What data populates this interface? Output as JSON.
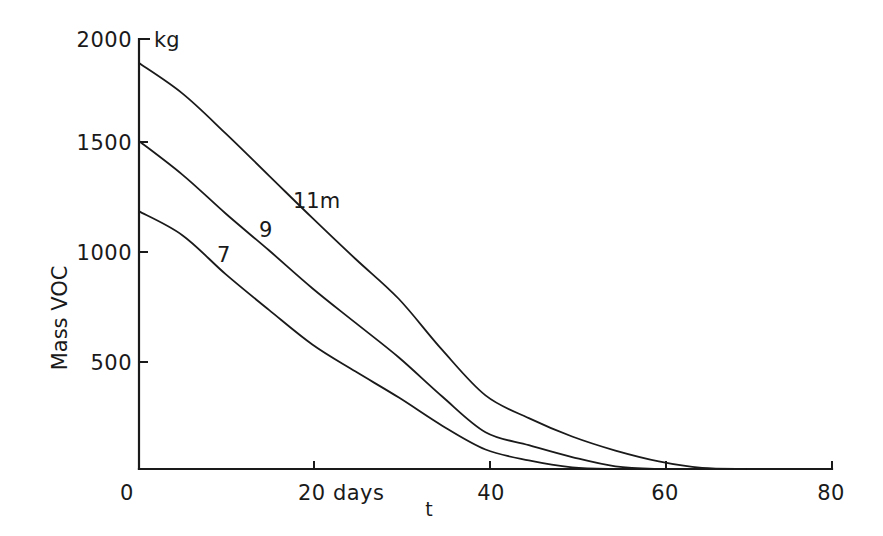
{
  "chart_data": {
    "type": "line",
    "title": "",
    "xlabel": "t",
    "x_unit_label": "days",
    "ylabel": "Mass VOC",
    "y_unit_label": "kg",
    "xlim": [
      0,
      80
    ],
    "ylim": [
      0,
      2000
    ],
    "x_ticks": [
      0,
      20,
      40,
      60,
      80
    ],
    "x_tick_labels": [
      "0",
      "20 days",
      "40",
      "60",
      "80"
    ],
    "y_ticks": [
      500,
      1000,
      1500,
      2000
    ],
    "y_tick_labels": [
      "500",
      "1000",
      "1500",
      "2000"
    ],
    "grid": false,
    "legend": "inline curve labels",
    "x": [
      0,
      5,
      10,
      15,
      20,
      25,
      30,
      35,
      40,
      45,
      50,
      55,
      60,
      65,
      70
    ],
    "series": [
      {
        "name": "11m",
        "label": "11m",
        "values": [
          1875,
          1735,
          1550,
          1355,
          1160,
          970,
          785,
          550,
          340,
          235,
          150,
          85,
          35,
          5,
          0
        ]
      },
      {
        "name": "9",
        "label": "9",
        "values": [
          1515,
          1360,
          1180,
          1010,
          835,
          675,
          515,
          335,
          170,
          110,
          55,
          12,
          0,
          0,
          0
        ]
      },
      {
        "name": "7",
        "label": "7",
        "values": [
          1190,
          1080,
          900,
          735,
          575,
          450,
          330,
          200,
          90,
          40,
          8,
          0,
          0,
          0,
          0
        ]
      }
    ]
  },
  "axes": {
    "y_unit": "kg",
    "y_title": "Mass VOC",
    "x_title": "t",
    "y_tick_labels": [
      "2000",
      "1500",
      "1000",
      "500"
    ],
    "x_tick_labels": [
      "0",
      "20 days",
      "40",
      "60",
      "80"
    ]
  },
  "series_labels": {
    "s11": "11m",
    "s9": "9",
    "s7": "7"
  }
}
